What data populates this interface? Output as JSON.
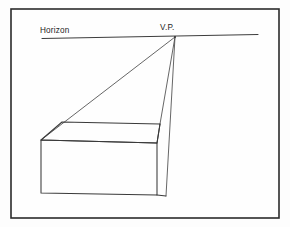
{
  "figure": {
    "kind": "one-point-perspective-construction",
    "background_color": "#fdfdfd",
    "frame": {
      "name": "border",
      "x": 11,
      "y": 9,
      "width": 268,
      "height": 209,
      "stroke_color": "#2b2b2b"
    },
    "labels": {
      "horizon": "Horizon",
      "vanishing_point": "V.P."
    },
    "horizon": {
      "x1": 42,
      "y1": 38.5,
      "x2": 258,
      "y2": 34.5,
      "stroke_color": "#3d3d3d",
      "label_x": 40,
      "label_y": 32
    },
    "vanishing_point": {
      "x": 175,
      "y": 37,
      "label_x": 160,
      "label_y": 30
    },
    "box": {
      "stroke_color": "#3a3a3a",
      "vertices": {
        "front_top_left": {
          "x": 41,
          "y": 140
        },
        "front_top_right": {
          "x": 157,
          "y": 143
        },
        "front_bottom_left": {
          "x": 41,
          "y": 193
        },
        "front_bottom_right": {
          "x": 157,
          "y": 195
        },
        "back_top_left": {
          "x": 62,
          "y": 122
        },
        "back_top_right": {
          "x": 160,
          "y": 124
        }
      }
    },
    "convergence_lines": [
      {
        "name": "left-corner-to-vp",
        "x1": 41,
        "y1": 140,
        "x2": 175,
        "y2": 37
      },
      {
        "name": "top-right-corner-to-vp",
        "x1": 160,
        "y1": 124,
        "x2": 175,
        "y2": 37
      },
      {
        "name": "bottom-right-corner-to-vp",
        "x1": 166,
        "y1": 196,
        "x2": 175,
        "y2": 37
      }
    ]
  }
}
